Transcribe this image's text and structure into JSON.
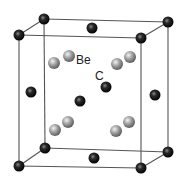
{
  "diagram": {
    "labels": {
      "be": {
        "text": "Be",
        "x": 76,
        "y": 64
      },
      "c": {
        "text": "C",
        "x": 95,
        "y": 80
      }
    },
    "colors": {
      "edge": "#555555",
      "carbon_dark": "#000000",
      "carbon_mid": "#2a2a2a",
      "carbon_light": "#8a8a8a",
      "be_dark": "#555555",
      "be_mid": "#9a9a9a",
      "be_light": "#f2f2f2"
    },
    "cube_vertices": {
      "ftl": [
        19,
        35
      ],
      "btl": [
        44,
        19
      ],
      "btr": [
        168,
        22
      ],
      "ftr": [
        141,
        38
      ],
      "fbl": [
        19,
        166
      ],
      "bbl": [
        45,
        148
      ],
      "bbr": [
        168,
        152
      ],
      "fbr": [
        141,
        168
      ]
    },
    "edges": [
      [
        "ftl",
        "btl"
      ],
      [
        "btl",
        "btr"
      ],
      [
        "btr",
        "ftr"
      ],
      [
        "ftr",
        "ftl"
      ],
      [
        "fbl",
        "bbl"
      ],
      [
        "bbl",
        "bbr"
      ],
      [
        "bbr",
        "fbr"
      ],
      [
        "fbr",
        "fbl"
      ],
      [
        "ftl",
        "fbl"
      ],
      [
        "btl",
        "bbl"
      ],
      [
        "btr",
        "bbr"
      ],
      [
        "ftr",
        "fbr"
      ]
    ],
    "carbon_atoms": [
      {
        "name": "corner-front-top-left",
        "x": 19,
        "y": 35,
        "r": 5.5
      },
      {
        "name": "corner-back-top-left",
        "x": 44,
        "y": 19,
        "r": 5.5
      },
      {
        "name": "corner-back-top-right",
        "x": 168,
        "y": 22,
        "r": 5.5
      },
      {
        "name": "corner-front-top-right",
        "x": 141,
        "y": 38,
        "r": 5.5
      },
      {
        "name": "corner-front-bottom-left",
        "x": 19,
        "y": 166,
        "r": 5.5
      },
      {
        "name": "corner-back-bottom-left",
        "x": 45,
        "y": 148,
        "r": 5.5
      },
      {
        "name": "corner-back-bottom-right",
        "x": 168,
        "y": 152,
        "r": 5.5
      },
      {
        "name": "corner-front-bottom-right",
        "x": 141,
        "y": 168,
        "r": 5.5
      },
      {
        "name": "face-top",
        "x": 92,
        "y": 28,
        "r": 5.5
      },
      {
        "name": "face-left",
        "x": 31,
        "y": 92,
        "r": 5.5
      },
      {
        "name": "face-right",
        "x": 155,
        "y": 95,
        "r": 5.5
      },
      {
        "name": "face-bottom",
        "x": 94,
        "y": 158,
        "r": 5.5
      },
      {
        "name": "face-back",
        "x": 106,
        "y": 87,
        "r": 5.5
      },
      {
        "name": "face-front",
        "x": 80,
        "y": 101,
        "r": 5.5
      }
    ],
    "be_atoms": [
      {
        "name": "be-1",
        "x": 54,
        "y": 63,
        "r": 6
      },
      {
        "name": "be-2",
        "x": 69,
        "y": 56,
        "r": 6
      },
      {
        "name": "be-3",
        "x": 117,
        "y": 64,
        "r": 6
      },
      {
        "name": "be-4",
        "x": 130,
        "y": 57,
        "r": 6
      },
      {
        "name": "be-5",
        "x": 55,
        "y": 130,
        "r": 6
      },
      {
        "name": "be-6",
        "x": 68,
        "y": 122,
        "r": 6
      },
      {
        "name": "be-7",
        "x": 116,
        "y": 131,
        "r": 6
      },
      {
        "name": "be-8",
        "x": 129,
        "y": 122,
        "r": 6
      }
    ]
  }
}
